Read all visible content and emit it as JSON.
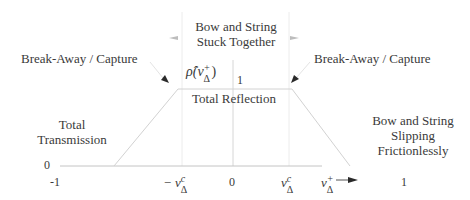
{
  "labels": {
    "stuck_line1": "Bow and String",
    "stuck_line2": "Stuck Together",
    "breakaway_left": "Break-Away / Capture",
    "breakaway_right": "Break-Away / Capture",
    "rho_symbol": "ρ̂(v",
    "rho_close": ")",
    "plateau_value": "1",
    "total_reflection": "Total Reflection",
    "total_transmission_line1": "Total",
    "total_transmission_line2": "Transmission",
    "slipping_line1": "Bow and String",
    "slipping_line2": "Slipping",
    "slipping_line3": "Frictionlessly",
    "y_zero": "0"
  },
  "x_ticks": {
    "minus_one": "-1",
    "minus_vc_prefix": "− v",
    "zero": "0",
    "vc": "v",
    "vplus": "v",
    "one": "1"
  },
  "math": {
    "sup_c": "c",
    "sup_plus": "+",
    "sub_delta": "Δ"
  },
  "colors": {
    "text": "#3a3a3a",
    "line": "#cfcfcf",
    "axis": "#bdbdbd",
    "arrow": "#2a2a2a"
  }
}
